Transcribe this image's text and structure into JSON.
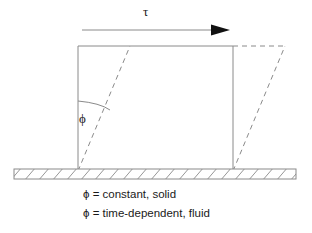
{
  "figure": {
    "name": "shear-deformation-diagram",
    "stroke_color": "#8a8a8a",
    "text_color": "#1a1a1a",
    "background_color": "#ffffff",
    "shear_arrow": {
      "label": "τ",
      "icon": "right-arrow-icon",
      "line_start_x": 82,
      "line_end_x": 230,
      "line_y": 30
    },
    "angle": {
      "label": "ϕ",
      "icon": "angle-arc-icon"
    },
    "solid_block": {
      "left": 78,
      "right": 233,
      "top": 46,
      "bottom": 171
    },
    "sheared_block": {
      "shear_offset": 52,
      "style": "dashed"
    },
    "ground": {
      "icon": "hatched-ground-icon",
      "left": 14,
      "right": 296,
      "top": 169,
      "bottom": 179
    },
    "captions": [
      "ϕ = constant, solid",
      "ϕ = time-dependent, fluid"
    ]
  }
}
